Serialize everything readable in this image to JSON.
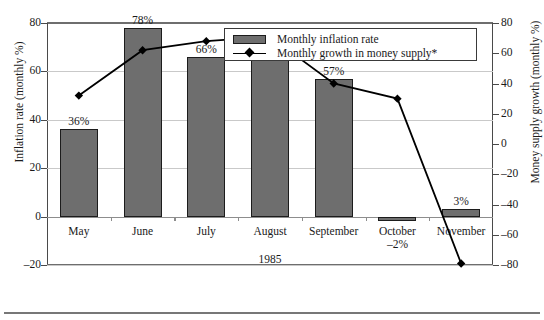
{
  "chart_data": {
    "type": "bar",
    "title": "",
    "xlabel": "1985",
    "categories": [
      "May",
      "June",
      "July",
      "August",
      "September",
      "October",
      "November"
    ],
    "series": [
      {
        "name": "Monthly inflation rate",
        "type": "bar",
        "axis": "left",
        "values": [
          36,
          78,
          66,
          66,
          57,
          -2,
          3
        ],
        "data_labels": [
          "36%",
          "78%",
          "66%",
          "66%",
          "57%",
          "-2%",
          "3%"
        ],
        "color": "#6e6e6e"
      },
      {
        "name": "Monthly growth in money supply*",
        "type": "line",
        "axis": "right",
        "values": [
          32,
          62,
          68,
          71,
          40,
          30,
          -79
        ],
        "color": "#000000",
        "marker": "diamond"
      }
    ],
    "axes": {
      "left": {
        "label": "Inflation rate (monthly %)",
        "ylim": [
          -20,
          80
        ],
        "ticks": [
          80,
          60,
          40,
          20,
          0,
          -20
        ],
        "tick_labels": [
          "80",
          "60",
          "40",
          "20",
          "0",
          "-20"
        ]
      },
      "right": {
        "label": "Money supply growth (monthly %)",
        "ylim": [
          -80,
          80
        ],
        "ticks": [
          80,
          60,
          40,
          20,
          0,
          -20,
          -40,
          -60,
          -80
        ],
        "tick_labels": [
          "80",
          "60",
          "40",
          "20",
          "0",
          "-20",
          "-40",
          "-60",
          "-80"
        ]
      }
    },
    "grid": true,
    "legend_position": "top-right",
    "legend_entries": [
      "Monthly inflation rate",
      "Monthly growth in money supply*"
    ]
  },
  "legend": {
    "bar_label": "Monthly inflation rate",
    "line_label": "Monthly growth in money supply*"
  },
  "axis_titles": {
    "left": "Inflation rate (monthly %)",
    "right": "Money supply growth (monthly %)"
  },
  "x_axis": {
    "year": "1985"
  }
}
